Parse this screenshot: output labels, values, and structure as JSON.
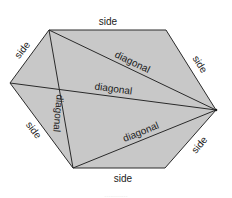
{
  "diagram": {
    "fill_color": "#c8c8c8",
    "stroke_color": "#2a2a2a",
    "vertices": {
      "top_left": [
        49,
        30
      ],
      "top_right": [
        166,
        30
      ],
      "right": [
        216,
        110
      ],
      "bottom_right": [
        165,
        168
      ],
      "bottom_left": [
        73,
        168
      ],
      "left": [
        10,
        83
      ]
    },
    "labels": {
      "side_top": "side",
      "side_upper_left": "side",
      "side_upper_right": "side",
      "side_lower_left": "side",
      "side_lower_right": "side",
      "side_bottom": "side",
      "diagonal_upper": "diagonal",
      "diagonal_middle": "diagonal",
      "diagonal_vertical": "diagonal",
      "diagonal_lower": "diagonal"
    },
    "caption": "............"
  }
}
